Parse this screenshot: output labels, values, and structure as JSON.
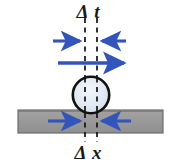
{
  "figure": {
    "title_top": "Δ t",
    "title_bottom": "Δ x",
    "background_color": "#ffffff"
  },
  "labels": {
    "delta_t": "Δ t",
    "delta_x": "Δ x"
  },
  "colors": {
    "arrow_blue": "#3355bb",
    "arrow_blue_dark": "#2b47a8",
    "bar_gray": "#9a9a9a",
    "bar_border": "#5a5a5a",
    "circle_fill": "#dde6f2",
    "circle_stroke": "#111111",
    "dash_black": "#111111",
    "text_black": "#1a1a1a",
    "background": "#ffffff"
  },
  "geometry": {
    "canvas_width": 177,
    "canvas_height": 168,
    "dashed_line_left_x": 85,
    "dashed_line_right_x": 97,
    "dashed_line_top_y": 18,
    "dashed_line_bottom_y": 142,
    "circle_center_x": 91,
    "circle_center_y": 95,
    "circle_radius": 18,
    "bar_left_x": 18,
    "bar_right_x": 163,
    "bar_top_y": 110,
    "bar_bottom_y": 133
  },
  "arrows": {
    "top_pair": {
      "name": "time-interval-arrows",
      "direction": "inward",
      "y": 41,
      "left_tail_x": 53,
      "left_head_x": 84,
      "right_tail_x": 126,
      "right_head_x": 98
    },
    "middle": {
      "name": "velocity-arrow",
      "direction": "right",
      "y": 63,
      "tail_x": 58,
      "head_x": 129
    },
    "bottom_pair": {
      "name": "displacement-arrows",
      "direction": "inward",
      "y": 121,
      "left_tail_x": 48,
      "left_head_x": 84,
      "right_tail_x": 131,
      "right_head_x": 98
    }
  },
  "elements": {
    "ball": "rolling-ball",
    "surface": "gray-surface-bar"
  }
}
